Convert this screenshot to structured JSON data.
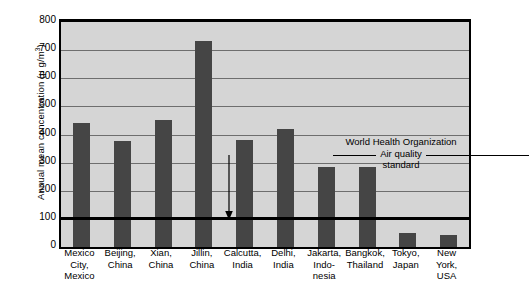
{
  "chart_data": {
    "type": "bar",
    "title": "",
    "xlabel": "",
    "ylabel": "Annual mean concentration (μ g/m³)",
    "ylabel_main": "Annual mean concentration (μ g/m",
    "ylabel_sup": "3",
    "ylabel_tail": ")",
    "ylim": [
      0,
      800
    ],
    "ytick_step": 100,
    "yticks": [
      0,
      100,
      200,
      300,
      400,
      500,
      600,
      700,
      800
    ],
    "ytick_labels": [
      "0",
      "100",
      "200",
      "300",
      "400",
      "500",
      "600",
      "700",
      "800"
    ],
    "grid": true,
    "legend": "none",
    "bar_color": "#454545",
    "plot_background": "#d5d5d5",
    "axis_color": "#000000",
    "gridline_color": "#6e6e6e",
    "categories": [
      "Mexico City, Mexico",
      "Beijing, China",
      "Xian, China",
      "Jillin, China",
      "Calcutta, India",
      "Delhi, India",
      "Jakarta, Indonesia",
      "Bangkok, Thailand",
      "Tokyo, Japan",
      "New York, USA"
    ],
    "category_lines": [
      [
        "Mexico",
        "City,",
        "Mexico"
      ],
      [
        "Beijing,",
        "China"
      ],
      [
        "Xian,",
        "China"
      ],
      [
        "Jillin,",
        "China"
      ],
      [
        "Calcutta,",
        "India"
      ],
      [
        "Delhi,",
        "India"
      ],
      [
        "Jakarta,",
        "Indo-",
        "nesia"
      ],
      [
        "Bangkok,",
        "Thailand"
      ],
      [
        "Tokyo,",
        "Japan"
      ],
      [
        "New",
        "York,",
        "USA"
      ]
    ],
    "values": [
      440,
      378,
      450,
      732,
      380,
      420,
      283,
      283,
      50,
      42
    ],
    "annotations": [
      {
        "name": "who-standard",
        "lines": [
          "World Health Organization",
          "Air quality",
          "standard"
        ],
        "value": 100,
        "has_leader_line": true,
        "has_arrow": true
      }
    ]
  }
}
